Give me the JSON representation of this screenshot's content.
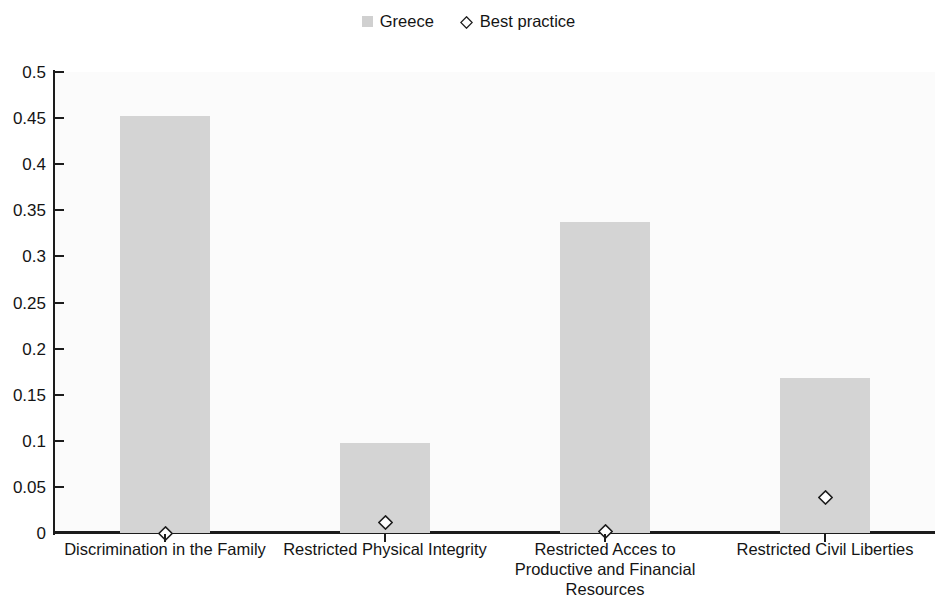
{
  "chart_data": {
    "type": "bar",
    "title": "",
    "subtitle": "",
    "xlabel": "",
    "ylabel": "",
    "ylim": [
      0,
      0.5
    ],
    "ytick_values": [
      0,
      0.05,
      0.1,
      0.15,
      0.2,
      0.25,
      0.3,
      0.35,
      0.4,
      0.45,
      0.5
    ],
    "ytick_labels": [
      "0",
      "0.05",
      "0.1",
      "0.15",
      "0.2",
      "0.25",
      "0.3",
      "0.35",
      "0.4",
      "0.45",
      "0.5"
    ],
    "grid": false,
    "legend_position": "top-center",
    "categories": [
      "Discrimination in the Family",
      "Restricted Physical Integrity",
      "Restricted Acces to Productive and Financial Resources",
      "Restricted Civil Liberties"
    ],
    "category_label_lines": [
      [
        "Discrimination in the Family"
      ],
      [
        "Restricted Physical Integrity"
      ],
      [
        "Restricted Acces to",
        "Productive and Financial",
        "Resources"
      ],
      [
        "Restricted Civil Liberties"
      ]
    ],
    "series": [
      {
        "name": "Greece",
        "type": "bar",
        "color": "#d4d4d4",
        "values": [
          0.452,
          0.098,
          0.337,
          0.168
        ]
      },
      {
        "name": "Best practice",
        "type": "scatter",
        "marker": "diamond",
        "color": "#ffffff",
        "edge_color": "#1c1c1c",
        "values": [
          0.0,
          0.011,
          0.002,
          0.039
        ]
      }
    ]
  },
  "legend": {
    "items": [
      {
        "label": "Greece",
        "marker": "square-swatch",
        "color": "#d0d0d0"
      },
      {
        "label": "Best practice",
        "marker": "diamond-swatch",
        "color": "#ffffff"
      }
    ]
  },
  "axes": {
    "y": {
      "labels": [
        "0.5",
        "0.45",
        "0.4",
        "0.35",
        "0.3",
        "0.25",
        "0.2",
        "0.15",
        "0.1",
        "0.05",
        "0"
      ]
    }
  }
}
